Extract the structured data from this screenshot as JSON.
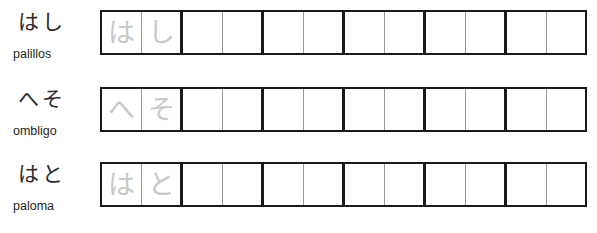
{
  "worksheet": {
    "title": "Hiragana writing practice",
    "columns_per_row": 12,
    "cells_per_group": 2,
    "trace_color": "#c9c9c9",
    "grid_border_color": "#1a1a1a",
    "grid_divider_color": "#9a9a9a"
  },
  "rows": [
    {
      "kana": "はし",
      "meaning": "palillos",
      "trace_cells": [
        "は",
        "し"
      ],
      "empty_cells": 10
    },
    {
      "kana": "へそ",
      "meaning": "ombligo",
      "trace_cells": [
        "へ",
        "そ"
      ],
      "empty_cells": 10
    },
    {
      "kana": "はと",
      "meaning": "paloma",
      "trace_cells": [
        "は",
        "と"
      ],
      "empty_cells": 10
    }
  ]
}
